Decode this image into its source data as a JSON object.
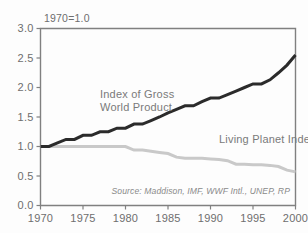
{
  "chart_data": {
    "type": "line",
    "title": "",
    "subtitle": "",
    "note": "1970=1.0",
    "source": "Source: Maddison, IMF, WWF Intl., UNEP, RP",
    "xlabel": "",
    "ylabel": "",
    "xlim": [
      1970,
      2000
    ],
    "ylim": [
      0.0,
      3.0
    ],
    "grid": false,
    "legend_position": "inline-annotation",
    "x_ticks": [
      1970,
      1975,
      1980,
      1985,
      1990,
      1995,
      2000
    ],
    "x_tick_labels": [
      "1970",
      "1975",
      "1980",
      "1985",
      "1990",
      "1995",
      "2000"
    ],
    "y_ticks": [
      0.0,
      0.5,
      1.0,
      1.5,
      2.0,
      2.5,
      3.0
    ],
    "y_tick_labels": [
      "0.0",
      "0.5",
      "1.0",
      "1.5",
      "2.0",
      "2.5",
      "3.0"
    ],
    "x": [
      1970,
      1971,
      1972,
      1973,
      1974,
      1975,
      1976,
      1977,
      1978,
      1979,
      1980,
      1981,
      1982,
      1983,
      1984,
      1985,
      1986,
      1987,
      1988,
      1989,
      1990,
      1991,
      1992,
      1993,
      1994,
      1995,
      1996,
      1997,
      1998,
      1999,
      2000
    ],
    "series": [
      {
        "name": "Index of Gross World Product",
        "color": "#2b2b2b",
        "stroke_width": 3.0,
        "label_x": 1977.0,
        "label_y": 1.82,
        "values": [
          1.0,
          1.0,
          1.06,
          1.12,
          1.12,
          1.19,
          1.19,
          1.25,
          1.25,
          1.31,
          1.31,
          1.38,
          1.38,
          1.44,
          1.5,
          1.57,
          1.63,
          1.69,
          1.69,
          1.76,
          1.82,
          1.82,
          1.88,
          1.94,
          2.0,
          2.06,
          2.06,
          2.13,
          2.25,
          2.38,
          2.55
        ]
      },
      {
        "name": "Living Planet Index",
        "color": "#c9c9c9",
        "stroke_width": 3.0,
        "label_x": 1991.0,
        "label_y": 1.06,
        "values": [
          1.0,
          1.0,
          1.0,
          1.0,
          1.0,
          1.0,
          1.0,
          1.0,
          1.0,
          1.0,
          1.0,
          0.94,
          0.94,
          0.92,
          0.9,
          0.88,
          0.82,
          0.8,
          0.8,
          0.8,
          0.79,
          0.78,
          0.76,
          0.7,
          0.7,
          0.69,
          0.69,
          0.68,
          0.66,
          0.6,
          0.57
        ]
      }
    ]
  }
}
